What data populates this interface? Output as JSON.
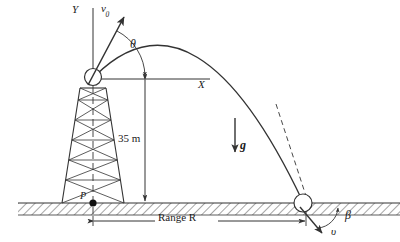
{
  "figure": {
    "colors": {
      "stroke": "#333333",
      "ground_hatch": "#5a5a5a",
      "background": "#ffffff",
      "text": "#1a1a1a"
    },
    "labels": {
      "y_axis": "Y",
      "x_axis": "X",
      "initial_velocity": "v",
      "initial_velocity_subscript": "0",
      "launch_angle": "θ",
      "tower_height": "35 m",
      "gravity": "g",
      "base_point": "P",
      "range": "Range R",
      "impact_angle": "β",
      "impact_velocity": "υ"
    },
    "values": {
      "tower_height_m": 35,
      "height_unit": "m"
    },
    "geometry": {
      "launch_point": [
        93,
        77
      ],
      "apex": [
        196,
        12
      ],
      "landing_point": [
        303,
        203
      ],
      "base_point_P": [
        93,
        203
      ],
      "ground_y": 203,
      "x_axis_y": 79,
      "x_axis_end": 196,
      "y_axis_top": 8,
      "range_dimension_y": 219
    },
    "icons": {
      "launch_marker": "circle-marker",
      "landing_marker": "circle-marker",
      "base_marker": "filled-dot",
      "gravity_arrow": "down-arrow-icon",
      "velocity_arrow": "up-right-arrow-icon",
      "impact_arrow": "down-right-arrow-icon",
      "angle_arc": "arc-icon",
      "ground": "hatched-ground-icon",
      "tower": "lattice-tower-icon",
      "trajectory": "parabola-curve",
      "tangent": "dashed-tangent-line"
    }
  }
}
